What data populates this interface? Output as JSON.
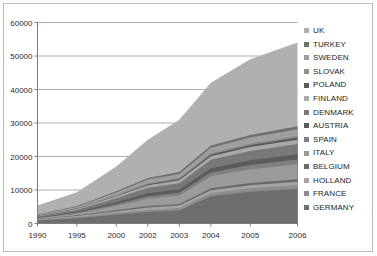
{
  "chart_data": {
    "type": "area",
    "title": "",
    "subtitle": "",
    "xlabel": "",
    "ylabel": "",
    "stacked": true,
    "grid": true,
    "legend_position": "right",
    "categories": [
      "1990",
      "1995",
      "2000",
      "2002",
      "2003",
      "2004",
      "2005",
      "2006"
    ],
    "x_tick_labels": [
      "1990",
      "1995",
      "2000",
      "2002",
      "2003",
      "2004",
      "2005",
      "2006"
    ],
    "y_tick_labels": [
      "0",
      "10000",
      "20000",
      "30000",
      "40000",
      "50000",
      "60000"
    ],
    "y_ticks": [
      0,
      10000,
      20000,
      30000,
      40000,
      50000,
      60000
    ],
    "ylim": [
      0,
      60000
    ],
    "series": [
      {
        "name": "GERMANY",
        "color": "#6e6e6e",
        "values": [
          900,
          1600,
          2600,
          3400,
          3900,
          8100,
          9500,
          10400
        ]
      },
      {
        "name": "FRANCE",
        "color": "#8c8c8c",
        "values": [
          200,
          350,
          500,
          650,
          700,
          900,
          1000,
          1100
        ]
      },
      {
        "name": "HOLLAND",
        "color": "#a4a4a4",
        "values": [
          150,
          300,
          500,
          700,
          750,
          900,
          950,
          1000
        ]
      },
      {
        "name": "BELGIUM",
        "color": "#6a6a6a",
        "values": [
          100,
          200,
          350,
          450,
          500,
          600,
          650,
          700
        ]
      },
      {
        "name": "ITALY",
        "color": "#9a9a9a",
        "values": [
          200,
          500,
          1300,
          2200,
          2500,
          3600,
          4100,
          4500
        ]
      },
      {
        "name": "SPAIN",
        "color": "#808080",
        "values": [
          100,
          250,
          500,
          700,
          800,
          1100,
          1250,
          1400
        ]
      },
      {
        "name": "AUSTRIA",
        "color": "#5c5c5c",
        "values": [
          150,
          300,
          600,
          900,
          1000,
          1300,
          1450,
          1600
        ]
      },
      {
        "name": "DENMARK",
        "color": "#787878",
        "values": [
          300,
          600,
          1200,
          1700,
          1900,
          2500,
          2750,
          3000
        ]
      },
      {
        "name": "FINLAND",
        "color": "#a8a8a8",
        "values": [
          150,
          300,
          550,
          750,
          850,
          1100,
          1200,
          1300
        ]
      },
      {
        "name": "POLAND",
        "color": "#5a5a5a",
        "values": [
          50,
          100,
          200,
          300,
          350,
          500,
          600,
          700
        ]
      },
      {
        "name": "SLOVAK",
        "color": "#8f8f8f",
        "values": [
          50,
          100,
          180,
          250,
          300,
          400,
          450,
          500
        ]
      },
      {
        "name": "SWEDEN",
        "color": "#9e9e9e",
        "values": [
          200,
          400,
          800,
          1100,
          1250,
          1600,
          1750,
          1900
        ]
      },
      {
        "name": "TURKEY",
        "color": "#707070",
        "values": [
          100,
          200,
          350,
          500,
          550,
          700,
          800,
          900
        ]
      },
      {
        "name": "UK",
        "color": "#b0b0b0",
        "values": [
          2700,
          4100,
          7400,
          11400,
          15650,
          18700,
          22550,
          25000
        ]
      }
    ],
    "series_totals": [
      5350,
      9300,
      17030,
      25000,
      31000,
      42000,
      49000,
      54000
    ]
  },
  "legend": {
    "items": [
      {
        "label": "UK",
        "color": "#b0b0b0"
      },
      {
        "label": "TURKEY",
        "color": "#707070"
      },
      {
        "label": "SWEDEN",
        "color": "#9e9e9e"
      },
      {
        "label": "SLOVAK",
        "color": "#8f8f8f"
      },
      {
        "label": "POLAND",
        "color": "#5a5a5a"
      },
      {
        "label": "FINLAND",
        "color": "#a8a8a8"
      },
      {
        "label": "DENMARK",
        "color": "#787878"
      },
      {
        "label": "AUSTRIA",
        "color": "#5c5c5c"
      },
      {
        "label": "SPAIN",
        "color": "#808080"
      },
      {
        "label": "ITALY",
        "color": "#9a9a9a"
      },
      {
        "label": "BELGIUM",
        "color": "#6a6a6a"
      },
      {
        "label": "HOLLAND",
        "color": "#a4a4a4"
      },
      {
        "label": "FRANCE",
        "color": "#8c8c8c"
      },
      {
        "label": "GERMANY",
        "color": "#6e6e6e"
      }
    ]
  },
  "style": {
    "grid_color": "#9a9a9a",
    "axis_color": "#7d7d7d",
    "frame_color": "#b9b9b9",
    "text_color": "#2b2b2b",
    "plot_background": "#ffffff"
  }
}
